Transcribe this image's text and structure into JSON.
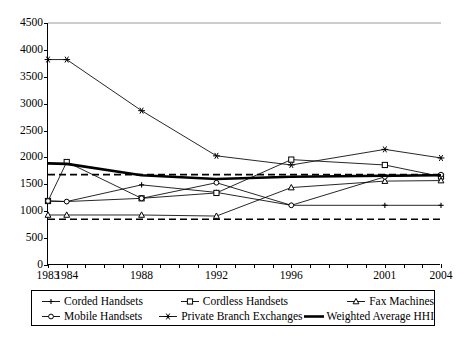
{
  "chart_data": {
    "type": "line",
    "title": "",
    "xlabel": "",
    "ylabel": "",
    "ylim": [
      0,
      4500
    ],
    "ytick_values": [
      0,
      500,
      1000,
      1500,
      2000,
      2500,
      3000,
      3500,
      4000,
      4500
    ],
    "ytick_labels": [
      "0",
      "500",
      "1000",
      "1500",
      "2000",
      "2500",
      "3000",
      "3500",
      "4000",
      "4500"
    ],
    "grid": false,
    "legend_position": "below",
    "xlim": [
      1983,
      2004
    ],
    "x_tick_years": [
      1983,
      1984,
      1985,
      1986,
      1987,
      1988,
      1989,
      1990,
      1991,
      1992,
      1993,
      1994,
      1995,
      1996,
      1997,
      1998,
      1999,
      2000,
      2001,
      2002,
      2003,
      2004
    ],
    "xtick_labels": [
      {
        "year": 1983,
        "label": "1983"
      },
      {
        "year": 1984,
        "label": "1984"
      },
      {
        "year": 1988,
        "label": "1988"
      },
      {
        "year": 1992,
        "label": "1992"
      },
      {
        "year": 1996,
        "label": "1996"
      },
      {
        "year": 2001,
        "label": "2001"
      },
      {
        "year": 2004,
        "label": "2004"
      }
    ],
    "reference_lines": [
      {
        "name": "highly-concentrated-threshold",
        "value": 1680,
        "style": "dashed"
      },
      {
        "name": "unconcentrated-threshold",
        "value": 850,
        "style": "dashed"
      }
    ],
    "series": [
      {
        "name": "Corded Handsets",
        "marker": "cross-small",
        "x": [
          1983,
          1984,
          1988,
          1992,
          1996,
          2001,
          2004
        ],
        "values": [
          1190,
          1180,
          1490,
          1350,
          1110,
          1110,
          1110
        ]
      },
      {
        "name": "Cordless Handsets",
        "marker": "square",
        "x": [
          1983,
          1984,
          1988,
          1992,
          1996,
          2001,
          2004
        ],
        "values": [
          1190,
          1915,
          1240,
          1340,
          1960,
          1860,
          1645
        ]
      },
      {
        "name": "Fax Machines",
        "marker": "triangle",
        "x": [
          1983,
          1984,
          1988,
          1992,
          1996,
          2001,
          2004
        ],
        "values": [
          930,
          930,
          930,
          910,
          1440,
          1560,
          1570
        ]
      },
      {
        "name": "Mobile Handsets",
        "marker": "circle",
        "x": [
          1983,
          1984,
          1988,
          1992,
          1996,
          2001,
          2004
        ],
        "values": [
          1190,
          1180,
          1240,
          1530,
          1110,
          1640,
          1680
        ]
      },
      {
        "name": "Private Branch Exchanges",
        "marker": "star",
        "x": [
          1983,
          1984,
          1988,
          1992,
          1996,
          2001,
          2004
        ],
        "values": [
          3820,
          3820,
          2870,
          2030,
          1860,
          2150,
          1990
        ]
      },
      {
        "name": "Weighted Average HHI",
        "marker": "none",
        "thick": true,
        "x": [
          1983,
          1984,
          1988,
          1992,
          1996,
          2001,
          2004
        ],
        "values": [
          1890,
          1880,
          1670,
          1600,
          1640,
          1660,
          1670
        ]
      }
    ]
  },
  "legend": {
    "row1": [
      {
        "label": "Corded Handsets",
        "marker": "cross-small"
      },
      {
        "label": "Cordless Handsets",
        "marker": "square"
      },
      {
        "label": "Fax Machines",
        "marker": "triangle"
      }
    ],
    "row2": [
      {
        "label": "Mobile Handsets",
        "marker": "circle"
      },
      {
        "label": "Private Branch Exchanges",
        "marker": "star"
      },
      {
        "label": "Weighted Average HHI",
        "marker": "none"
      }
    ]
  }
}
